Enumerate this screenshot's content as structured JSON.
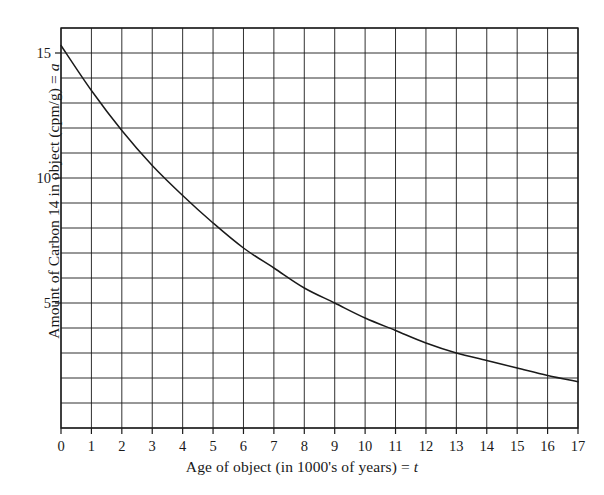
{
  "chart_data": {
    "type": "line",
    "title": "",
    "xlabel": "Age of object (in 1000's of years) = t",
    "ylabel": "Amount of Carbon 14 in object (cpm/g) = a",
    "xlabel_parts": {
      "text": "Age of object (in 1000's of years) =",
      "variable": "t"
    },
    "ylabel_parts": {
      "text": "Amount of Carbon 14 in object (cpm/g) =",
      "variable": "a"
    },
    "xlim": [
      0,
      17
    ],
    "ylim": [
      0,
      16
    ],
    "grid": "on",
    "grid_step_x": 1,
    "grid_step_y": 1,
    "legend": "none",
    "x_tick_labels": [
      "0",
      "1",
      "2",
      "3",
      "4",
      "5",
      "6",
      "7",
      "8",
      "9",
      "10",
      "11",
      "12",
      "13",
      "14",
      "15",
      "16",
      "17"
    ],
    "x_tick_values": [
      0,
      1,
      2,
      3,
      4,
      5,
      6,
      7,
      8,
      9,
      10,
      11,
      12,
      13,
      14,
      15,
      16,
      17
    ],
    "y_tick_labels": [
      "5",
      "10",
      "15"
    ],
    "y_tick_values": [
      5,
      10,
      15
    ],
    "series": [
      {
        "name": "Carbon 14 decay",
        "color": "#1a1a1a",
        "x": [
          0,
          1,
          2,
          3,
          4,
          5,
          6,
          7,
          8,
          9,
          10,
          11,
          12,
          13,
          14,
          15,
          16,
          17
        ],
        "values": [
          15.3,
          13.5,
          11.9,
          10.5,
          9.3,
          8.2,
          7.2,
          6.4,
          5.6,
          5.0,
          4.4,
          3.9,
          3.4,
          3.0,
          2.7,
          2.4,
          2.1,
          1.85
        ]
      }
    ]
  }
}
